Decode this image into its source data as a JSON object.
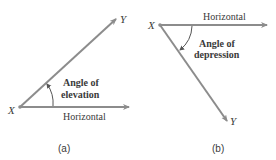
{
  "colors": {
    "line": "#8c8c8c",
    "text": "#3a3a3a",
    "background": "#ffffff"
  },
  "panel_a": {
    "caption": "(a)",
    "vertex_label": "X",
    "end_label": "Y",
    "horizontal_label": "Horizontal",
    "angle_label_line1": "Angle of",
    "angle_label_line2": "elevation"
  },
  "panel_b": {
    "caption": "(b)",
    "vertex_label": "X",
    "end_label": "Y",
    "horizontal_label": "Horizontal",
    "angle_label_line1": "Angle of",
    "angle_label_line2": "depression"
  }
}
